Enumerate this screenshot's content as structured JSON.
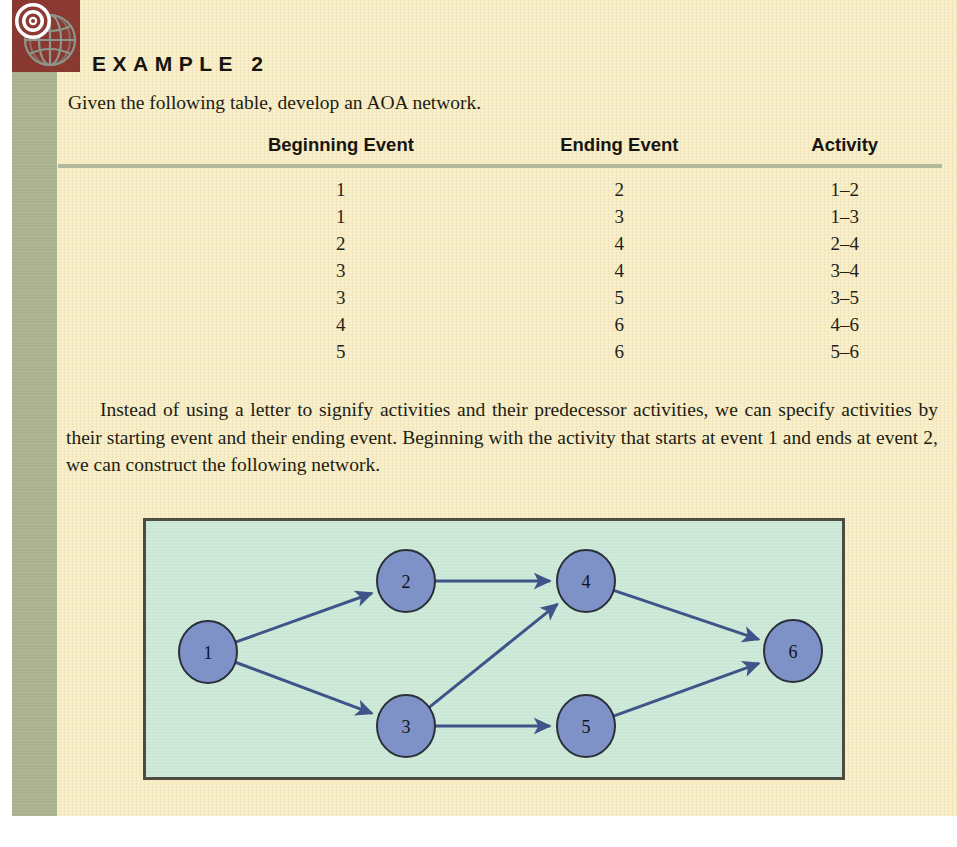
{
  "heading": "EXAMPLE 2",
  "intro": "Given the following table, develop an AOA network.",
  "table": {
    "headers": [
      "Beginning Event",
      "Ending Event",
      "Activity"
    ],
    "rows": [
      [
        "1",
        "2",
        "1–2"
      ],
      [
        "1",
        "3",
        "1–3"
      ],
      [
        "2",
        "4",
        "2–4"
      ],
      [
        "3",
        "4",
        "3–4"
      ],
      [
        "3",
        "5",
        "3–5"
      ],
      [
        "4",
        "6",
        "4–6"
      ],
      [
        "5",
        "6",
        "5–6"
      ]
    ]
  },
  "paragraph": "Instead of using a letter to signify activities and their predecessor activities, we can specify activities by their starting event and their ending event. Beginning with the activity that starts at event 1 and ends at event 2, we can construct the following network.",
  "diagram": {
    "nodes": [
      {
        "id": "1",
        "label": "1",
        "cx": 62,
        "cy": 131,
        "rx": 29,
        "ry": 31
      },
      {
        "id": "2",
        "label": "2",
        "cx": 260,
        "cy": 60,
        "rx": 29,
        "ry": 31
      },
      {
        "id": "3",
        "label": "3",
        "cx": 260,
        "cy": 205,
        "rx": 29,
        "ry": 31
      },
      {
        "id": "4",
        "label": "4",
        "cx": 440,
        "cy": 60,
        "rx": 29,
        "ry": 31
      },
      {
        "id": "5",
        "label": "5",
        "cx": 440,
        "cy": 205,
        "rx": 29,
        "ry": 31
      },
      {
        "id": "6",
        "label": "6",
        "cx": 647,
        "cy": 130,
        "rx": 29,
        "ry": 31
      }
    ],
    "edges": [
      {
        "from": "1",
        "to": "2"
      },
      {
        "from": "1",
        "to": "3"
      },
      {
        "from": "2",
        "to": "4"
      },
      {
        "from": "3",
        "to": "4"
      },
      {
        "from": "3",
        "to": "5"
      },
      {
        "from": "4",
        "to": "6"
      },
      {
        "from": "5",
        "to": "6"
      }
    ]
  },
  "colors": {
    "page_cream": "#f7ecc4",
    "sage_band": "#a9b08c",
    "icon_block_red": "#8d3a33",
    "diagram_background": "#cae7d6",
    "diagram_border": "#4d4c42",
    "node_fill": "#7f92c8",
    "node_stroke": "#2b3038",
    "edge_stroke": "#3f5488",
    "rule_sage": "#b3ba9c"
  },
  "icons": {
    "globe_target": "globe-target-icon"
  }
}
